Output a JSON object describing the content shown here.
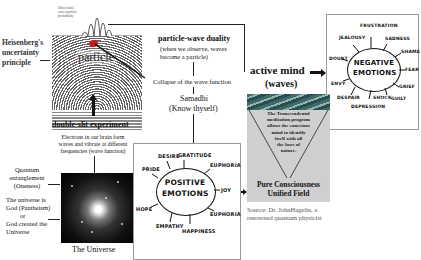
{
  "top_graph": {
    "caption": "Observable wave/particle probability"
  },
  "labels": {
    "particle": "particle",
    "heisenberg": [
      "Heisenberg's",
      "uncertainty",
      "principle"
    ],
    "double_slit": "double-slit experiment",
    "duality_title": "particle-wave duality",
    "duality_sub": [
      "(when we observe, waves",
      "become a particle)"
    ],
    "collapse": "Collapse of the wave function",
    "samadhi": "Samadhi",
    "know_thyself": "(Know thyself)",
    "active_mind": "active mind",
    "waves": "(waves)",
    "electrons": [
      "Electrons in our brain form",
      "waves and vibrate at different",
      "frequencies (wave function)"
    ],
    "entanglement": [
      "Quantum",
      "entanglement",
      "(Oneness)"
    ],
    "pantheism": [
      "The universe is",
      "God (Pantheism)",
      "or",
      "God created the",
      "Universe"
    ],
    "universe": "The Universe",
    "tm_text": [
      "The Transcendental",
      "meditation program",
      "allows the conscious",
      "mind to identify",
      "itself with all",
      "the laws of",
      "nature."
    ],
    "pure": [
      "Pure Consciousness",
      "Unified Field"
    ],
    "source": [
      "Source: Dr. JohnHagelin, a",
      "renowned quantum physicist"
    ]
  },
  "positive": {
    "center": [
      "POSITIVE",
      "EMOTIONS"
    ],
    "items": [
      "DESIRE",
      "GRATITUDE",
      "PRIDE",
      "EUPHORIA",
      "JOY",
      "HOPE",
      "EUPHORIA",
      "EMPATHY",
      "HAPPINESS"
    ]
  },
  "negative": {
    "center": [
      "NEGATIVE",
      "EMOTIONS"
    ],
    "items": [
      "FRUSTRATION",
      "JEALOUSY",
      "SADNESS",
      "DOUBT",
      "SHAME",
      "FEAR",
      "ENVY",
      "GRIEF",
      "DESPAIR",
      "SHOCK",
      "GUILT",
      "DEPRESSION"
    ]
  },
  "colors": {
    "particle": "#c02020",
    "tm_background": "#cfcfcf",
    "box_border": "#999999"
  }
}
